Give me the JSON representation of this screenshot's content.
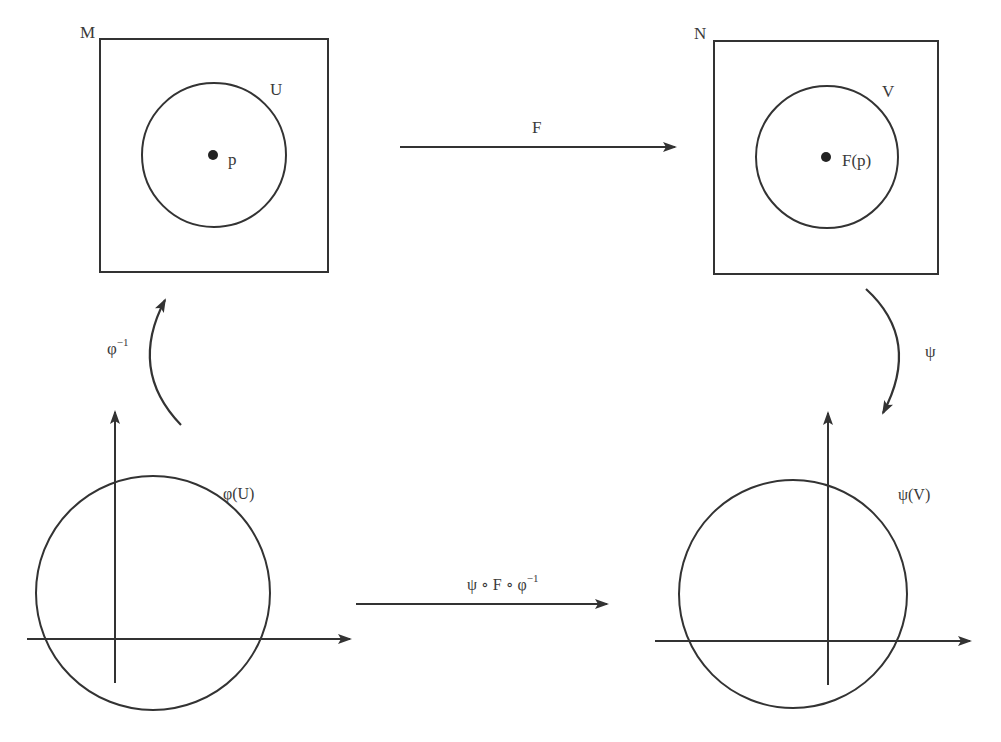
{
  "diagram": {
    "colors": {
      "ink": "#333333",
      "label": "#3a3a3a",
      "background": "#ffffff"
    },
    "manifold_M": {
      "label": "M",
      "box": {
        "x": 100,
        "y": 39,
        "w": 228,
        "h": 233
      },
      "open_set": {
        "label": "U",
        "cx": 214,
        "cy": 155,
        "r": 72
      },
      "point": {
        "label": "p",
        "cx": 213,
        "cy": 155
      }
    },
    "manifold_N": {
      "label": "N",
      "box": {
        "x": 714,
        "y": 41,
        "w": 224,
        "h": 233
      },
      "open_set": {
        "label": "V",
        "cx": 827,
        "cy": 157,
        "r": 71
      },
      "point": {
        "label": "F(p)",
        "cx": 826,
        "cy": 157
      }
    },
    "map_F": {
      "label": "F",
      "x1": 400,
      "y1": 147,
      "x2": 675,
      "y2": 147
    },
    "chart_inverse_phi": {
      "label_base": "φ",
      "label_sup": "−1"
    },
    "chart_psi": {
      "label": "ψ"
    },
    "euclidean_left": {
      "label": "φ(U)",
      "circle": {
        "cx": 153,
        "cy": 593,
        "r": 117
      },
      "y_axis": {
        "x": 115,
        "y1": 683,
        "y2": 412
      },
      "x_axis": {
        "y": 639,
        "x1": 27,
        "x2": 350
      }
    },
    "euclidean_right": {
      "label": "ψ(V)",
      "circle": {
        "cx": 793,
        "cy": 594,
        "r": 114
      },
      "y_axis": {
        "x": 828,
        "y1": 685,
        "y2": 413
      },
      "x_axis": {
        "y": 641,
        "x1": 655,
        "x2": 970
      }
    },
    "coordinate_map": {
      "label_main": "ψ ∘ F ∘ φ",
      "label_sup": "−1",
      "x1": 356,
      "y1": 604,
      "x2": 607,
      "y2": 604
    }
  }
}
